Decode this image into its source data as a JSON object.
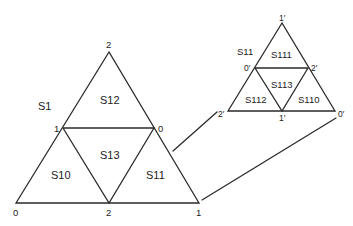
{
  "diagram": {
    "type": "subdivided-triangle-zoom",
    "large_triangle": {
      "region_label": "S1",
      "vertices": {
        "apex": "2",
        "mid_left": "1",
        "mid_right": "0",
        "bottom_left": "0",
        "bottom_mid": "2",
        "bottom_right": "1"
      },
      "subregions": {
        "top": "S12",
        "center": "S13",
        "left": "S10",
        "right": "S11"
      }
    },
    "small_triangle": {
      "region_label": "S11",
      "vertices": {
        "apex": "1′",
        "mid_left": "0′",
        "mid_right": "2′",
        "bottom_left": "2′",
        "bottom_mid": "1′",
        "bottom_right": "0′"
      },
      "subregions": {
        "top": "S111",
        "center": "S113",
        "left": "S112",
        "right": "S110"
      }
    },
    "connectors": [
      "S11 region to small triangle bottom-left",
      "big bottom-right to small bottom-right"
    ],
    "colors": {
      "stroke": "#2a2a2a",
      "text": "#222222",
      "background": "#ffffff"
    }
  }
}
